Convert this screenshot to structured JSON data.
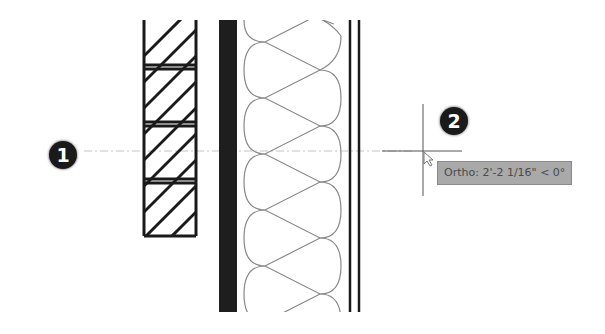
{
  "drawing": {
    "type": "wall-section-plan-view",
    "layers": [
      {
        "name": "brick-veneer",
        "pattern": "diagonal-hatch",
        "courses": 4
      },
      {
        "name": "air-gap"
      },
      {
        "name": "sheathing",
        "fill": "#1e1e1e"
      },
      {
        "name": "batt-insulation",
        "pattern": "loops"
      },
      {
        "name": "gypsum-board",
        "lines": 2
      }
    ],
    "colors": {
      "line": "#1a1a1a",
      "insulation": "#888888",
      "dashed_reference": "#bbbbbb",
      "cursor": "#555555"
    }
  },
  "callouts": [
    {
      "id": "1",
      "label": "1"
    },
    {
      "id": "2",
      "label": "2"
    }
  ],
  "tooltip": {
    "text": "Ortho: 2'-2 1/16\" < 0°",
    "background": "#a9a9a9"
  }
}
